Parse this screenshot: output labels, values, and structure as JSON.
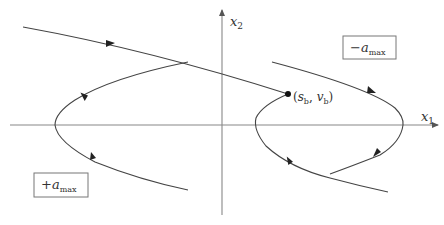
{
  "diagram": {
    "type": "phase-plane",
    "axes": {
      "x_label": "x",
      "x_sub": "1",
      "y_label": "x",
      "y_sub": "2"
    },
    "regions": [
      {
        "name": "upper-right",
        "sign": "−",
        "var": "a",
        "sub": "max"
      },
      {
        "name": "lower-left",
        "sign": "+",
        "var": "a",
        "sub": "max"
      }
    ],
    "switch_point": {
      "label_open": "(",
      "s": "s",
      "s_sub": "b",
      "comma": ", ",
      "v": "v",
      "v_sub": "b",
      "label_close": ")"
    },
    "colors": {
      "curve": "#444444",
      "axis": "#888888",
      "text": "#333333",
      "box_border": "#777777"
    }
  }
}
